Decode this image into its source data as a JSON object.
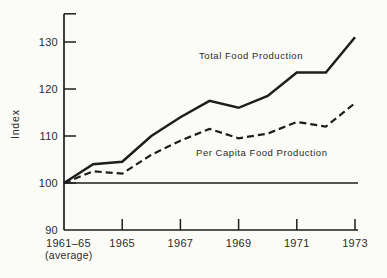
{
  "chart_data": {
    "type": "line",
    "title": "",
    "ylabel": "Index",
    "x_categories": [
      "1961-65 (average)",
      "1964",
      "1965",
      "1966",
      "1967",
      "1968",
      "1969",
      "1970",
      "1971",
      "1972",
      "1973"
    ],
    "series": [
      {
        "name": "Total Food Production",
        "line_style": "solid",
        "values": [
          100,
          104,
          104.5,
          110,
          114,
          117.5,
          116,
          118.5,
          123.5,
          123.5,
          131
        ]
      },
      {
        "name": "Per Capita Food Production",
        "line_style": "dashed",
        "values": [
          100,
          102.5,
          102,
          106,
          109,
          111.5,
          109.5,
          110.5,
          113,
          112,
          117
        ]
      }
    ],
    "y_axis": {
      "range": [
        90,
        136
      ],
      "baseline_value": 100,
      "ticks": [
        {
          "value": 130,
          "label": "130",
          "has_mark": true
        },
        {
          "value": 120,
          "label": "120",
          "has_mark": true
        },
        {
          "value": 110,
          "label": "110",
          "has_mark": true
        },
        {
          "value": 100,
          "label": "100",
          "has_mark": true
        },
        {
          "value": 90,
          "label": "90",
          "has_mark": false
        }
      ]
    },
    "x_axis": {
      "first_label_line1": "1961–65",
      "first_label_line2": "(average)",
      "ticks": [
        {
          "index": 2,
          "label": "1965"
        },
        {
          "index": 4,
          "label": "1967"
        },
        {
          "index": 6,
          "label": "1969"
        },
        {
          "index": 8,
          "label": "1971"
        },
        {
          "index": 10,
          "label": "1973"
        }
      ]
    },
    "grid": false,
    "legend_position": "inline-annotations",
    "line_color": "#1e1e1e",
    "text_color": "#2b2b2b",
    "background_color": "#fbfbf8"
  }
}
